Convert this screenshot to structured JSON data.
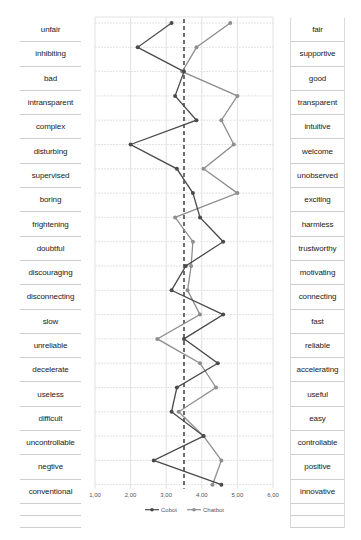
{
  "chart_data": {
    "type": "line",
    "title": "",
    "xlabel": "",
    "ylabel": "",
    "orientation": "horizontal-profile",
    "xlim": [
      1,
      6
    ],
    "x_ticks": [
      "1,00",
      "2,00",
      "3,00",
      "4,00",
      "5,00",
      "6,00"
    ],
    "reference_line": {
      "x": 3.5,
      "style": "dashed"
    },
    "grid": true,
    "legend_position": "bottom",
    "left_labels": [
      "unfair",
      "inhibiting",
      "bad",
      "intransparent",
      "complex",
      "disturbing",
      "supervised",
      "boring",
      "frightening",
      "doubtful",
      "discouraging",
      "disconnecting",
      "slow",
      "unreliable",
      "decelerate",
      "useless",
      "difficult",
      "uncontrollable",
      "negtive",
      "conventional"
    ],
    "right_labels": [
      "fair",
      "supportive",
      "good",
      "transparent",
      "intuitive",
      "welcome",
      "unobserved",
      "exciting",
      "harmless",
      "trustworthy",
      "motivating",
      "connecting",
      "fast",
      "reliable",
      "accelerating",
      "useful",
      "easy",
      "controllable",
      "positive",
      "innovative"
    ],
    "series": [
      {
        "name": "Cobot",
        "color": "#4a4a4a",
        "values": [
          3.15,
          2.2,
          3.5,
          3.25,
          3.85,
          2.0,
          3.3,
          3.75,
          3.95,
          4.6,
          3.55,
          3.15,
          4.6,
          3.5,
          4.45,
          3.3,
          3.15,
          4.05,
          2.65,
          4.55
        ]
      },
      {
        "name": "Chatbot",
        "color": "#8e8e8e",
        "values": [
          4.8,
          3.85,
          3.45,
          5.0,
          4.55,
          4.9,
          4.05,
          5.0,
          3.25,
          3.75,
          3.7,
          3.6,
          3.95,
          2.75,
          3.95,
          4.4,
          3.35,
          4.05,
          4.55,
          4.3
        ]
      }
    ]
  }
}
